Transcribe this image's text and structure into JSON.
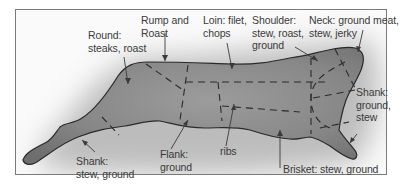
{
  "diagram": {
    "type": "beef-cuts-diagram",
    "colors": {
      "body_fill": "#8a8a8a",
      "body_outline": "#2a2a2a",
      "cut_lines": "#2a2a2a",
      "label_text": "#3a3a3a",
      "frame_border": "#7a7a7a",
      "shadow": "#9a9a9a"
    },
    "labels": [
      {
        "id": "round",
        "lines": [
          "Round:",
          "steaks, roast"
        ]
      },
      {
        "id": "rump",
        "lines": [
          "Rump and",
          "Roast"
        ]
      },
      {
        "id": "loin",
        "lines": [
          "Loin: filet,",
          "chops"
        ]
      },
      {
        "id": "shoulder",
        "lines": [
          "Shoulder:",
          "stew, roast,",
          "ground"
        ]
      },
      {
        "id": "neck",
        "lines": [
          "Neck: ground meat,",
          "stew, jerky"
        ]
      },
      {
        "id": "shank_front",
        "lines": [
          "Shank:",
          "ground,",
          "stew"
        ]
      },
      {
        "id": "shank_rear",
        "lines": [
          "Shank:",
          "stew, ground"
        ]
      },
      {
        "id": "flank",
        "lines": [
          "Flank:",
          "ground"
        ]
      },
      {
        "id": "ribs",
        "lines": [
          "ribs"
        ]
      },
      {
        "id": "brisket",
        "lines": [
          "Brisket: stew, ground"
        ]
      }
    ]
  }
}
